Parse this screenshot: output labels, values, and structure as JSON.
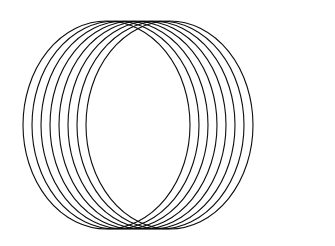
{
  "figure": {
    "background_color": "#ffffff",
    "stroke_color": "#0d0d0d",
    "fill": "none",
    "stroke_width": 1.1,
    "canvas": {
      "width": 335,
      "height": 246
    }
  },
  "chart_data": {
    "type": "scatter",
    "subtitle": "",
    "xlabel": "",
    "ylabel": "",
    "xlim": [
      0,
      335
    ],
    "ylim": [
      0,
      246
    ],
    "grid": false,
    "legend_position": "none",
    "tick_labels_x": [],
    "tick_labels_y": [],
    "annotations": [],
    "shape_type": "ellipse",
    "shape_count": 8,
    "common_points": [
      {
        "name": "top-node",
        "x": 168,
        "y": 21
      },
      {
        "name": "bottom-node",
        "x": 168,
        "y": 229
      }
    ],
    "vertical_extent": [
      21,
      229
    ],
    "horizontal_extent": [
      23,
      314
    ],
    "ellipse_rx": 83.5,
    "ellipse_ry": 104,
    "center_y": 125,
    "series": [
      {
        "name": "ellipses",
        "values": [
          106.5,
          115.5,
          124.5,
          133.5,
          142.5,
          151.5,
          160.5,
          169.5
        ]
      }
    ],
    "ellipses": [
      {
        "id": 1,
        "cx": 106.5,
        "cy": 125,
        "rx": 83.5,
        "ry": 104
      },
      {
        "id": 2,
        "cx": 115.5,
        "cy": 125,
        "rx": 83.5,
        "ry": 104
      },
      {
        "id": 3,
        "cx": 124.5,
        "cy": 125,
        "rx": 83.5,
        "ry": 104
      },
      {
        "id": 4,
        "cx": 133.5,
        "cy": 125,
        "rx": 83.5,
        "ry": 104
      },
      {
        "id": 5,
        "cx": 142.5,
        "cy": 125,
        "rx": 83.5,
        "ry": 104
      },
      {
        "id": 6,
        "cx": 151.5,
        "cy": 125,
        "rx": 83.5,
        "ry": 104
      },
      {
        "id": 7,
        "cx": 160.5,
        "cy": 125,
        "rx": 83.5,
        "ry": 104
      },
      {
        "id": 8,
        "cx": 169.5,
        "cy": 125,
        "rx": 83.5,
        "ry": 104
      }
    ]
  }
}
